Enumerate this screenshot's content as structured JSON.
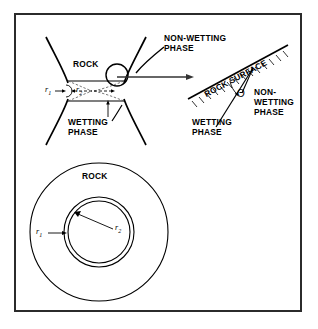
{
  "figure": {
    "border_color": "#2b2b2b",
    "line_color": "#000000",
    "background": "#ffffff"
  },
  "top_panel": {
    "rock_label": "ROCK",
    "nonwetting_label_line1": "NON-WETTING",
    "nonwetting_label_line2": "PHASE",
    "wetting_label_line1": "WETTING",
    "wetting_label_line2": "PHASE",
    "radius_small_label": "r",
    "radius_small_sub": "1",
    "radius_large_label": "r",
    "radius_large_sub": "2"
  },
  "detail_panel": {
    "rock_surface_label": "ROCK SURFACE",
    "contact_angle_symbol": "Θ",
    "nonwetting_label_line1": "NON-",
    "nonwetting_label_line2": "WETTING",
    "nonwetting_label_line3": "PHASE",
    "wetting_label_line1": "WETTING",
    "wetting_label_line2": "PHASE"
  },
  "bottom_panel": {
    "rock_label": "ROCK",
    "radius_small_label": "r",
    "radius_small_sub": "1",
    "radius_large_label": "r",
    "radius_large_sub": "2"
  }
}
